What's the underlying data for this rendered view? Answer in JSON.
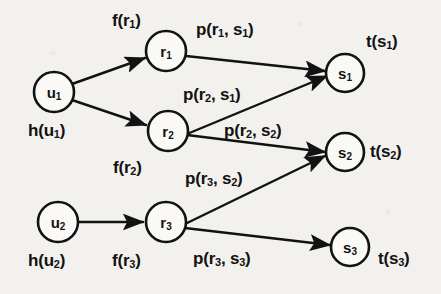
{
  "figure": {
    "background_color": "#f2f1ee",
    "ink_color": "#121212"
  },
  "nodes": [
    {
      "id": "u1",
      "label": "u",
      "sub": "1",
      "cx": 54,
      "cy": 92,
      "r": 20,
      "layer": "user"
    },
    {
      "id": "u2",
      "label": "u",
      "sub": "2",
      "cx": 58,
      "cy": 222,
      "r": 20,
      "layer": "user"
    },
    {
      "id": "r1",
      "label": "r",
      "sub": "1",
      "cx": 166,
      "cy": 51,
      "r": 20,
      "layer": "resource"
    },
    {
      "id": "r2",
      "label": "r",
      "sub": "2",
      "cx": 168,
      "cy": 131,
      "r": 20,
      "layer": "resource"
    },
    {
      "id": "r3",
      "label": "r",
      "sub": "3",
      "cx": 166,
      "cy": 222,
      "r": 20,
      "layer": "resource"
    },
    {
      "id": "s1",
      "label": "s",
      "sub": "1",
      "cx": 345,
      "cy": 73,
      "r": 19,
      "layer": "service"
    },
    {
      "id": "s2",
      "label": "s",
      "sub": "2",
      "cx": 345,
      "cy": 152,
      "r": 19,
      "layer": "service"
    },
    {
      "id": "s3",
      "label": "s",
      "sub": "3",
      "cx": 350,
      "cy": 247,
      "r": 19,
      "layer": "service"
    }
  ],
  "edges": [
    {
      "id": "e-u1-r1",
      "from": "u1",
      "to": "r1",
      "arrow": true
    },
    {
      "id": "e-u1-r2",
      "from": "u1",
      "to": "r2",
      "arrow": true
    },
    {
      "id": "e-u2-r3",
      "from": "u2",
      "to": "r3",
      "arrow": true
    },
    {
      "id": "e-r1-s1",
      "from": "r1",
      "to": "s1",
      "arrow": true
    },
    {
      "id": "e-r2-s1",
      "from": "r2",
      "to": "s1",
      "arrow": true
    },
    {
      "id": "e-r2-s2",
      "from": "r2",
      "to": "s2",
      "arrow": true
    },
    {
      "id": "e-r3-s2",
      "from": "r3",
      "to": "s2",
      "arrow": true
    },
    {
      "id": "e-r3-s3",
      "from": "r3",
      "to": "s3",
      "arrow": true
    }
  ],
  "labels": [
    {
      "id": "lbl-f-r1",
      "text": "f(r",
      "sub": "1",
      "tail": ")",
      "x": 112,
      "y": 12,
      "kind": "edge-weight",
      "for_edge": "e-u1-r1"
    },
    {
      "id": "lbl-p-r1s1",
      "text": "p(r",
      "sub": "1",
      "mid": ", s",
      "sub2": "1",
      "tail": ")",
      "x": 196,
      "y": 21,
      "kind": "edge-weight",
      "for_edge": "e-r1-s1"
    },
    {
      "id": "lbl-t-s1",
      "text": "t(s",
      "sub": "1",
      "tail": ")",
      "x": 366,
      "y": 33,
      "kind": "node-annotation",
      "for_node": "s1"
    },
    {
      "id": "lbl-p-r2s1",
      "text": "p(r",
      "sub": "2",
      "mid": ", s",
      "sub2": "1",
      "tail": ")",
      "x": 183,
      "y": 86,
      "kind": "edge-weight",
      "for_edge": "e-r2-s1"
    },
    {
      "id": "lbl-h-u1",
      "text": "h(u",
      "sub": "1",
      "tail": ")",
      "x": 28,
      "y": 122,
      "kind": "node-annotation",
      "for_node": "u1"
    },
    {
      "id": "lbl-p-r2s2",
      "text": "p(r",
      "sub": "2",
      "mid": ", s",
      "sub2": "2",
      "tail": ")",
      "x": 224,
      "y": 122,
      "kind": "edge-weight",
      "for_edge": "e-r2-s2"
    },
    {
      "id": "lbl-t-s2",
      "text": "t(s",
      "sub": "2",
      "tail": ")",
      "x": 370,
      "y": 143,
      "kind": "node-annotation",
      "for_node": "s2"
    },
    {
      "id": "lbl-f-r2",
      "text": "f(r",
      "sub": "2",
      "tail": ")",
      "x": 113,
      "y": 159,
      "kind": "edge-weight",
      "for_edge": "e-u1-r2"
    },
    {
      "id": "lbl-p-r3s2",
      "text": "p(r",
      "sub": "3",
      "mid": ", s",
      "sub2": "2",
      "tail": ")",
      "x": 185,
      "y": 170,
      "kind": "edge-weight",
      "for_edge": "e-r3-s2"
    },
    {
      "id": "lbl-h-u2",
      "text": "h(u",
      "sub": "2",
      "tail": ")",
      "x": 28,
      "y": 252,
      "kind": "node-annotation",
      "for_node": "u2"
    },
    {
      "id": "lbl-f-r3",
      "text": "f(r",
      "sub": "3",
      "tail": ")",
      "x": 112,
      "y": 252,
      "kind": "edge-weight",
      "for_edge": "e-u2-r3"
    },
    {
      "id": "lbl-p-r3s3",
      "text": "p(r",
      "sub": "3",
      "mid": ", s",
      "sub2": "3",
      "tail": ")",
      "x": 193,
      "y": 250,
      "kind": "edge-weight",
      "for_edge": "e-r3-s3"
    },
    {
      "id": "lbl-t-s3",
      "text": "t(s",
      "sub": "3",
      "tail": ")",
      "x": 378,
      "y": 250,
      "kind": "node-annotation",
      "for_node": "s3"
    }
  ]
}
